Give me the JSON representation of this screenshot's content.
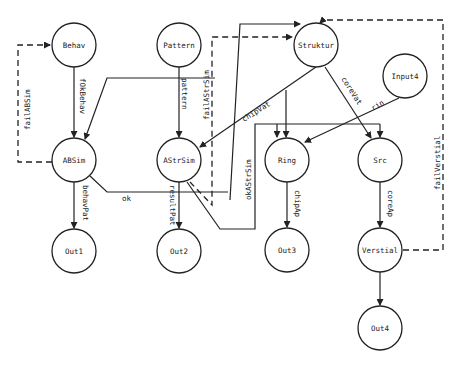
{
  "diagram": {
    "nodes": [
      {
        "id": "behav",
        "label": "Behav",
        "cx": 74,
        "cy": 45
      },
      {
        "id": "pattern",
        "label": "Pattern",
        "cx": 179,
        "cy": 45
      },
      {
        "id": "struktur",
        "label": "Struktur",
        "cx": 316,
        "cy": 45
      },
      {
        "id": "input4",
        "label": "Input4",
        "cx": 405,
        "cy": 76
      },
      {
        "id": "absim",
        "label": "ABSim",
        "cx": 74,
        "cy": 160
      },
      {
        "id": "astrsim",
        "label": "AStrSim",
        "cx": 179,
        "cy": 160
      },
      {
        "id": "ring",
        "label": "Ring",
        "cx": 287,
        "cy": 160
      },
      {
        "id": "src",
        "label": "Src",
        "cx": 380,
        "cy": 160
      },
      {
        "id": "out1",
        "label": "Out1",
        "cx": 74,
        "cy": 251
      },
      {
        "id": "out2",
        "label": "Out2",
        "cx": 179,
        "cy": 251
      },
      {
        "id": "out3",
        "label": "Out3",
        "cx": 287,
        "cy": 250
      },
      {
        "id": "verstial",
        "label": "Verstial",
        "cx": 380,
        "cy": 250
      },
      {
        "id": "out4",
        "label": "Out4",
        "cx": 380,
        "cy": 328
      }
    ],
    "edge_labels": {
      "fOkBehav": "fOkBehav",
      "pattern": "pattern",
      "failABSim": "failABSim",
      "failAStrSim": "failAStrSim",
      "chipVat": "chipVat",
      "coreVat": "coreVat",
      "rin": "rin",
      "okAStrSim": "okAStrSim",
      "behavPat": "behavPat",
      "resultPat": "resultPat",
      "ok": "ok",
      "chipAp": "chipAp",
      "coreAp": "coreAp",
      "failVerstial": "failVerstial"
    }
  }
}
